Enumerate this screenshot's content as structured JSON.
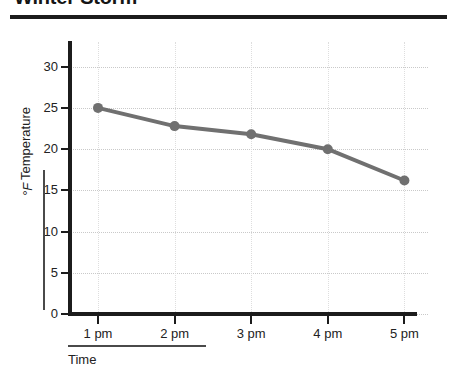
{
  "chart_data": {
    "type": "line",
    "title": "Winter Storm",
    "xlabel": "Time",
    "ylabel": "Temperature",
    "yunit": "°F",
    "categories": [
      "1 pm",
      "2 pm",
      "3 pm",
      "4 pm",
      "5 pm"
    ],
    "values": [
      25,
      22.8,
      21.8,
      20,
      16.2
    ],
    "ylim": [
      0,
      33
    ],
    "yticks": [
      0,
      5,
      10,
      15,
      20,
      25,
      30
    ],
    "ytick_labels": [
      "0",
      "5",
      "10",
      "15",
      "20",
      "25",
      "30"
    ],
    "grid": true,
    "legend": "none",
    "series_color": "#707070",
    "marker": "circle",
    "axis_color": "#1c1c1c",
    "grid_color": "#c9c9c9"
  }
}
